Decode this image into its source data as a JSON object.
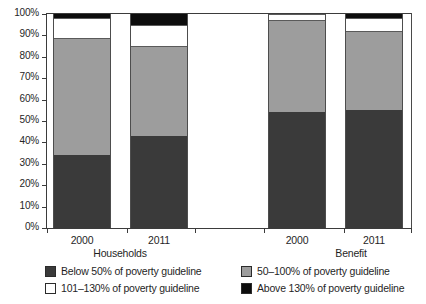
{
  "chart_data": {
    "type": "bar",
    "subtype": "stacked-bar-100-percent",
    "title": "",
    "xlabel": "",
    "ylabel": "",
    "ylim": [
      0,
      100
    ],
    "ytick_labels": [
      "0%",
      "10%",
      "20%",
      "30%",
      "40%",
      "50%",
      "60%",
      "70%",
      "80%",
      "90%",
      "100%"
    ],
    "ytick_values": [
      0,
      10,
      20,
      30,
      40,
      50,
      60,
      70,
      80,
      90,
      100
    ],
    "grid": false,
    "legend_position": "bottom",
    "groups": [
      {
        "name": "Households",
        "categories": [
          "2000",
          "2011"
        ]
      },
      {
        "name": "Benefit",
        "categories": [
          "2000",
          "2011"
        ]
      }
    ],
    "categories": [
      "2000",
      "2011",
      "2000",
      "2011"
    ],
    "bars": [
      {
        "group": "Households",
        "category": "2000",
        "values": [
          34,
          55,
          9,
          2
        ]
      },
      {
        "group": "Households",
        "category": "2011",
        "values": [
          43,
          42,
          10,
          5
        ]
      },
      {
        "group": "Benefit",
        "category": "2000",
        "values": [
          54,
          43,
          3,
          0
        ]
      },
      {
        "group": "Benefit",
        "category": "2011",
        "values": [
          55,
          37,
          6,
          2
        ]
      }
    ],
    "series": [
      {
        "name": "Below 50% of poverty guideline",
        "color": "#3a3a3a",
        "values": [
          34,
          43,
          54,
          55
        ]
      },
      {
        "name": "50–100% of poverty guideline",
        "color": "#9d9d9d",
        "values": [
          55,
          42,
          43,
          37
        ]
      },
      {
        "name": "101–130% of poverty guideline",
        "color": "#ffffff",
        "values": [
          9,
          10,
          3,
          6
        ]
      },
      {
        "name": "Above 130% of poverty guideline",
        "color": "#0d0d0d",
        "values": [
          2,
          5,
          0,
          2
        ]
      }
    ]
  },
  "axis": {
    "yticks": [
      {
        "label": "100%",
        "value": 100
      },
      {
        "label": "90%",
        "value": 90
      },
      {
        "label": "80%",
        "value": 80
      },
      {
        "label": "70%",
        "value": 70
      },
      {
        "label": "60%",
        "value": 60
      },
      {
        "label": "50%",
        "value": 50
      },
      {
        "label": "40%",
        "value": 40
      },
      {
        "label": "30%",
        "value": 30
      },
      {
        "label": "20%",
        "value": 20
      },
      {
        "label": "10%",
        "value": 10
      },
      {
        "label": "0%",
        "value": 0
      }
    ],
    "xticks": [
      {
        "label": "2000"
      },
      {
        "label": "2011"
      },
      {
        "label": "2000"
      },
      {
        "label": "2011"
      }
    ],
    "group_labels": [
      {
        "label": "Households"
      },
      {
        "label": "Benefit"
      }
    ]
  },
  "legend": {
    "items": [
      {
        "label": "Below 50% of poverty guideline",
        "swatch": "dark"
      },
      {
        "label": "50–100% of poverty guideline",
        "swatch": "gray"
      },
      {
        "label": "101–130% of poverty guideline",
        "swatch": "white"
      },
      {
        "label": "Above 130% of poverty guideline",
        "swatch": "black"
      }
    ]
  }
}
